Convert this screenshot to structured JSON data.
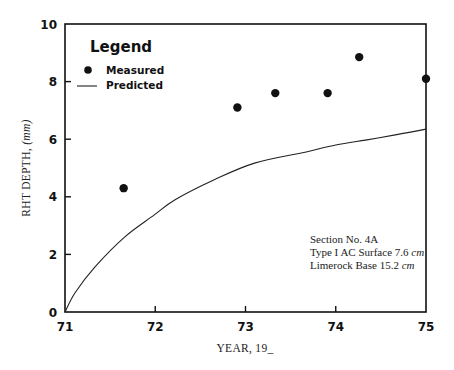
{
  "chart_data": {
    "type": "scatter",
    "title": "",
    "xlabel": "YEAR, 19_",
    "ylabel": "RHT DEPTH, (mm)",
    "xlim": [
      71,
      75
    ],
    "ylim": [
      0,
      10
    ],
    "x_ticks": [
      71,
      72,
      73,
      74,
      75
    ],
    "y_ticks": [
      0,
      2,
      4,
      6,
      8,
      10
    ],
    "x_tick_labels": [
      "71",
      "72",
      "73",
      "74",
      "75"
    ],
    "y_tick_labels": [
      "0",
      "2",
      "4",
      "6",
      "8",
      "10"
    ],
    "grid": false,
    "legend": {
      "title": "Legend",
      "position": "upper-left",
      "entries": [
        "Measured",
        "Predicted"
      ]
    },
    "series": [
      {
        "name": "Measured",
        "type": "scatter",
        "marker": "filled-circle",
        "x": [
          71.65,
          72.91,
          73.33,
          73.91,
          74.26,
          75.0
        ],
        "y": [
          4.3,
          7.1,
          7.6,
          7.6,
          8.85,
          8.1
        ]
      },
      {
        "name": "Predicted",
        "type": "line",
        "x": [
          71.0,
          71.11,
          71.33,
          71.66,
          71.99,
          72.22,
          72.66,
          73.1,
          73.66,
          74.0,
          74.33,
          74.66,
          75.0
        ],
        "y": [
          0.0,
          0.66,
          1.56,
          2.6,
          3.37,
          3.9,
          4.6,
          5.17,
          5.55,
          5.8,
          5.97,
          6.15,
          6.35
        ]
      }
    ],
    "annotations": [
      "Section No. 4A",
      "Type I AC Surface 7.6 cm",
      "Limerock Base 15.2 cm"
    ]
  },
  "labels": {
    "xlabel": "YEAR, 19_",
    "ylabel_main": "RHT DEPTH, ",
    "ylabel_unit": "(mm)",
    "legend_title": "Legend",
    "legend_measured": "Measured",
    "legend_predicted": "Predicted",
    "note_line1": "Section No. 4A",
    "note_line2_prefix": "Type I AC Surface 7.6 ",
    "note_line2_unit": "cm",
    "note_line3_prefix": "Limerock Base 15.2 ",
    "note_line3_unit": "cm"
  },
  "colors": {
    "ink": "#111111",
    "background": "#ffffff"
  }
}
